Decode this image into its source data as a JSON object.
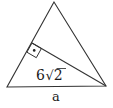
{
  "diagram": {
    "type": "triangle-with-altitude",
    "labels": {
      "base": "a",
      "altitude_coefficient": "6",
      "altitude_radicand": "2"
    },
    "right_angle_marker": "dot-in-square",
    "colors": {
      "stroke": "#333333",
      "text": "#1a1a1a",
      "background": "#ffffff"
    }
  }
}
